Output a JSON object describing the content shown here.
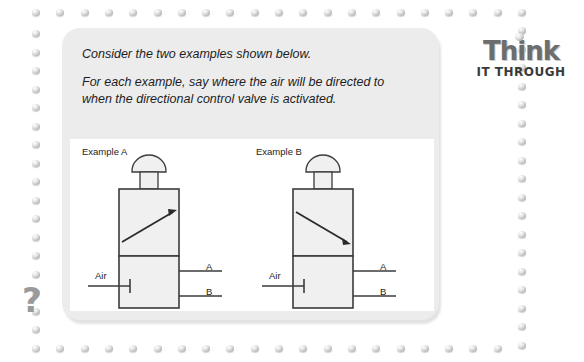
{
  "page": {
    "width": 584,
    "height": 362,
    "background": "#ffffff"
  },
  "logo": {
    "title": "Think",
    "subtitle": "IT THROUGH",
    "dot_icon": "bead-dot-icon"
  },
  "question_mark": "?",
  "prompt": {
    "line1": "Consider the two examples shown below.",
    "line2": "For each example, say where the air will be directed to when the directional control valve is activated."
  },
  "diagram": {
    "examples": [
      {
        "label": "Example A",
        "arrow_direction": "up",
        "ports": {
          "inlet": "Air",
          "outlet_top": "A",
          "outlet_bottom": "B"
        }
      },
      {
        "label": "Example B",
        "arrow_direction": "down",
        "ports": {
          "inlet": "Air",
          "outlet_top": "A",
          "outlet_bottom": "B"
        }
      }
    ]
  },
  "colors": {
    "card_background": "#ececed",
    "panel_background": "#ffffff",
    "line": "#3b3b3b",
    "valve_fill": "#f0f0f0",
    "bead": "#b9b9b9",
    "logo_think": "#6d6d6d",
    "logo_sub": "#3a3a3a",
    "qmark": "#9a9a9a"
  }
}
